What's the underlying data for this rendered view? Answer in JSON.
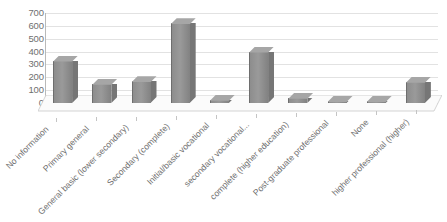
{
  "chart_data": {
    "type": "bar",
    "title": "",
    "subtitle": "",
    "xlabel": "",
    "ylabel": "",
    "ylim": [
      0,
      700
    ],
    "ytick_step": 100,
    "yticks": [
      700,
      600,
      500,
      400,
      300,
      200,
      100,
      0
    ],
    "grid": true,
    "legend": false,
    "legend_position": "none",
    "style": "3d-column",
    "bar_color": "#8d8d8d",
    "categories": [
      "No information",
      "Primary general",
      "General basic (lower secondary)",
      "Secondary (complete)",
      "Initial/basic vocational",
      "secondary vocational...",
      "complete (higher education)",
      "Post-graduate professional",
      "None",
      "higher professional (higher)"
    ],
    "values": [
      330,
      150,
      170,
      620,
      25,
      400,
      40,
      12,
      15,
      165
    ]
  },
  "colors": {
    "bar_front": "#8d8d8d",
    "bar_top": "#a6a6a6",
    "bar_side": "#767676",
    "axis": "#b9b9b9",
    "gridline": "#e2e2e2",
    "text": "#6f6f6f",
    "floor": "#fafafa",
    "floor_edge": "#c9c9c9"
  }
}
